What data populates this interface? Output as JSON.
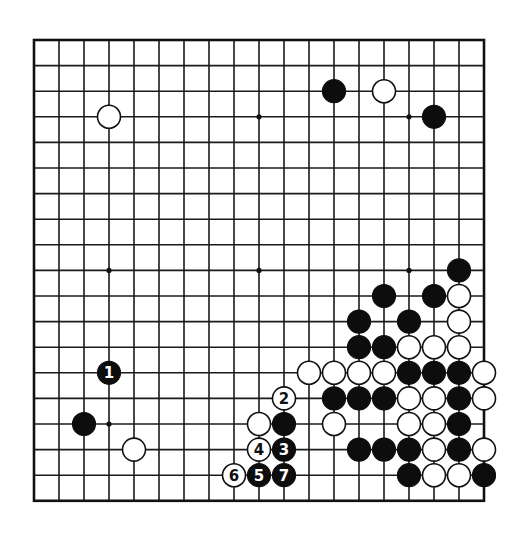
{
  "board": {
    "size": 19,
    "origin_x": 34,
    "origin_y": 40,
    "spacing_x": 25,
    "spacing_y": 25.6,
    "stone_radius": 11.5,
    "colors": {
      "line": "#1a1a1a",
      "black": "#0d0d0d",
      "white": "#ffffff",
      "background": "#ffffff"
    },
    "star_points": [
      [
        3,
        3
      ],
      [
        9,
        3
      ],
      [
        15,
        3
      ],
      [
        3,
        9
      ],
      [
        9,
        9
      ],
      [
        15,
        9
      ],
      [
        3,
        15
      ],
      [
        9,
        15
      ],
      [
        15,
        15
      ]
    ]
  },
  "stones": [
    {
      "color": "white",
      "col": 3,
      "row": 3
    },
    {
      "color": "black",
      "col": 12,
      "row": 2
    },
    {
      "color": "white",
      "col": 14,
      "row": 2
    },
    {
      "color": "black",
      "col": 16,
      "row": 3
    },
    {
      "color": "black",
      "col": 17,
      "row": 9
    },
    {
      "color": "black",
      "col": 14,
      "row": 10
    },
    {
      "color": "black",
      "col": 16,
      "row": 10
    },
    {
      "color": "white",
      "col": 17,
      "row": 10
    },
    {
      "color": "black",
      "col": 13,
      "row": 11
    },
    {
      "color": "black",
      "col": 15,
      "row": 11
    },
    {
      "color": "white",
      "col": 17,
      "row": 11
    },
    {
      "color": "black",
      "col": 13,
      "row": 12
    },
    {
      "color": "black",
      "col": 14,
      "row": 12
    },
    {
      "color": "white",
      "col": 15,
      "row": 12
    },
    {
      "color": "white",
      "col": 16,
      "row": 12
    },
    {
      "color": "white",
      "col": 17,
      "row": 12
    },
    {
      "color": "white",
      "col": 11,
      "row": 13
    },
    {
      "color": "white",
      "col": 12,
      "row": 13
    },
    {
      "color": "white",
      "col": 13,
      "row": 13
    },
    {
      "color": "white",
      "col": 14,
      "row": 13
    },
    {
      "color": "black",
      "col": 15,
      "row": 13
    },
    {
      "color": "black",
      "col": 16,
      "row": 13
    },
    {
      "color": "black",
      "col": 17,
      "row": 13
    },
    {
      "color": "white",
      "col": 18,
      "row": 13
    },
    {
      "color": "black",
      "col": 12,
      "row": 14
    },
    {
      "color": "black",
      "col": 13,
      "row": 14
    },
    {
      "color": "black",
      "col": 14,
      "row": 14
    },
    {
      "color": "white",
      "col": 15,
      "row": 14
    },
    {
      "color": "white",
      "col": 16,
      "row": 14
    },
    {
      "color": "black",
      "col": 17,
      "row": 14
    },
    {
      "color": "white",
      "col": 18,
      "row": 14
    },
    {
      "color": "white",
      "col": 9,
      "row": 15
    },
    {
      "color": "black",
      "col": 10,
      "row": 15
    },
    {
      "color": "white",
      "col": 12,
      "row": 15
    },
    {
      "color": "white",
      "col": 15,
      "row": 15
    },
    {
      "color": "white",
      "col": 16,
      "row": 15
    },
    {
      "color": "black",
      "col": 17,
      "row": 15
    },
    {
      "color": "black",
      "col": 13,
      "row": 16
    },
    {
      "color": "black",
      "col": 14,
      "row": 16
    },
    {
      "color": "black",
      "col": 15,
      "row": 16
    },
    {
      "color": "white",
      "col": 16,
      "row": 16
    },
    {
      "color": "black",
      "col": 17,
      "row": 16
    },
    {
      "color": "white",
      "col": 18,
      "row": 16
    },
    {
      "color": "black",
      "col": 15,
      "row": 17
    },
    {
      "color": "white",
      "col": 16,
      "row": 17
    },
    {
      "color": "white",
      "col": 17,
      "row": 17
    },
    {
      "color": "black",
      "col": 18,
      "row": 17
    },
    {
      "color": "black",
      "col": 2,
      "row": 15
    },
    {
      "color": "white",
      "col": 4,
      "row": 16
    }
  ],
  "moves": [
    {
      "number": "1",
      "color": "black",
      "col": 3,
      "row": 13
    },
    {
      "number": "2",
      "color": "white",
      "col": 10,
      "row": 14
    },
    {
      "number": "3",
      "color": "black",
      "col": 10,
      "row": 16
    },
    {
      "number": "4",
      "color": "white",
      "col": 9,
      "row": 16
    },
    {
      "number": "5",
      "color": "black",
      "col": 9,
      "row": 17
    },
    {
      "number": "6",
      "color": "white",
      "col": 8,
      "row": 17
    },
    {
      "number": "7",
      "color": "black",
      "col": 10,
      "row": 17
    }
  ]
}
